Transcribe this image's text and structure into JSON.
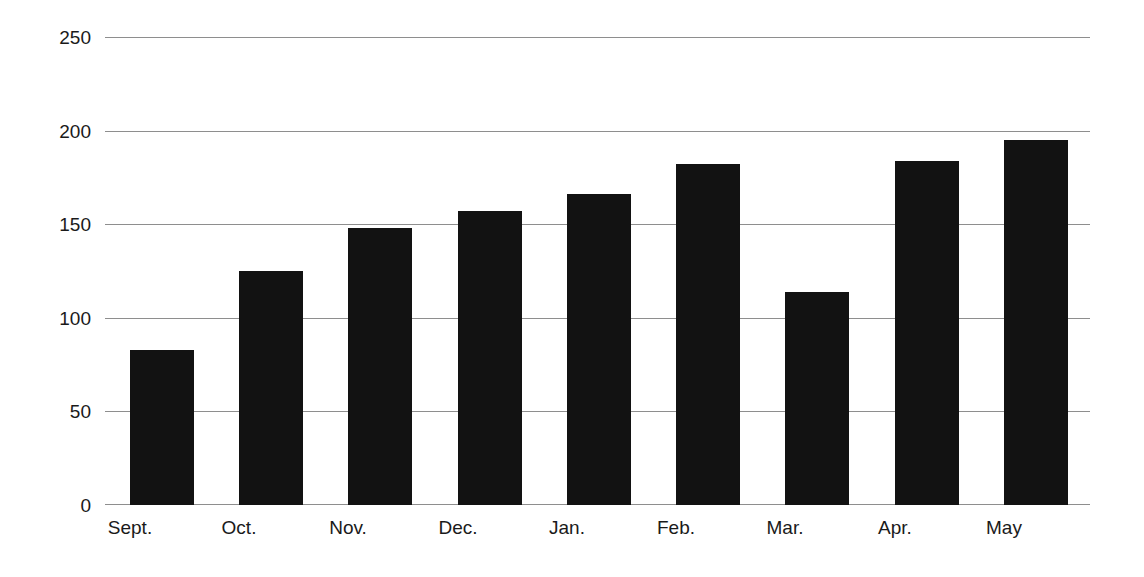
{
  "chart_data": {
    "type": "bar",
    "title": "",
    "subtitle": "",
    "xlabel": "",
    "ylabel": "",
    "categories": [
      "Sept.",
      "Oct.",
      "Nov.",
      "Dec.",
      "Jan.",
      "Feb.",
      "Mar.",
      "Apr.",
      "May"
    ],
    "values": [
      83,
      125,
      148,
      157,
      166,
      182,
      114,
      184,
      195
    ],
    "series": [
      {
        "name": "",
        "values": [
          83,
          125,
          148,
          157,
          166,
          182,
          114,
          184,
          195
        ]
      }
    ],
    "ylim": [
      0,
      250
    ],
    "yticks": [
      0,
      50,
      100,
      150,
      200,
      250
    ],
    "ytick_labels": [
      "0",
      "50",
      "100",
      "150",
      "200",
      "250"
    ],
    "grid": true,
    "grid_axis": "y",
    "legend": false,
    "legend_position": "none",
    "annotations": [],
    "colors": {
      "bar": "#121212",
      "gridline": "#8e8e8e",
      "background": "#ffffff",
      "text": "#1a1a1a"
    }
  }
}
